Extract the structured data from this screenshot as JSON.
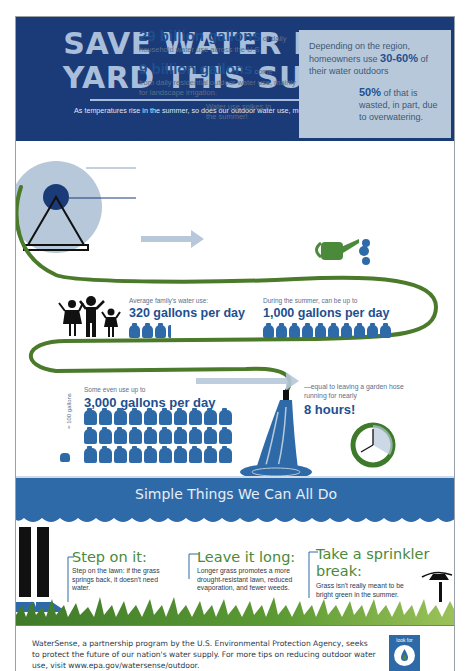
{
  "header": {
    "title_line1": "SAVE WATER IN THE",
    "title_line2": "YARD THIS SUMMER",
    "subtitle": "As temperatures rise in the summer, so does our outdoor water use, mostly on lawns and landscapes."
  },
  "household": {
    "stat1_big": "29 billion gallons",
    "stat1_suffix": " of daily",
    "stat1_desc": "household water use across the U.S.",
    "stat2_big": "9 billion gallons",
    "stat2_suffix": " come",
    "stat2_desc": "from daily residential outdoor water use, mainly for landscape irrigation.",
    "spike_text": "Water use spikes in the summer!"
  },
  "callout": {
    "p1_pre": "Depending on the region, homeowners use ",
    "p1_big": "30-60%",
    "p1_post": " of their water outdoors",
    "p2_big": "50%",
    "p2_post": " of that is wasted, in part, due to overwatering."
  },
  "family": {
    "avg_label": "Average family's water use:",
    "avg_value": "320 gallons per day",
    "avg_jugs": 3.2,
    "summer_label": "During the summer, can be up to",
    "summer_value": "1,000 gallons per day",
    "summer_jugs": 10
  },
  "extreme": {
    "label": "Some even use up to",
    "value": "3,000 gallons per day",
    "jugs": 30,
    "legend": "= 100 gallons",
    "equal_text": "—equal to leaving a garden hose running for nearly",
    "hours": "8 hours!"
  },
  "tips": {
    "title": "Simple Things We Can All Do",
    "items": [
      {
        "head": "Step on it:",
        "body": "Step on the lawn: if the grass springs back, it doesn't need water."
      },
      {
        "head": "Leave it long:",
        "body": "Longer grass promotes a more drought-resistant lawn, reduced evaporation, and fewer weeds."
      },
      {
        "head": "Take a sprinkler break:",
        "body": "Grass isn't really meant to be bright green in the summer."
      }
    ]
  },
  "footer": {
    "text": "WaterSense, a partnership program by the U.S. Environmental Protection Agency, seeks to protect the future of our nation's water supply. For more tips on reducing outdoor water use, visit www.epa.gov/watersense/outdoor.",
    "badge_label": "look for"
  },
  "colors": {
    "navy": "#1b3a78",
    "title_blue": "#a9bedb",
    "mid_blue": "#2f6aa8",
    "light_blue": "#b7c8da",
    "hose_green": "#4a7a2a",
    "grass_green": "#6a9a3a"
  }
}
